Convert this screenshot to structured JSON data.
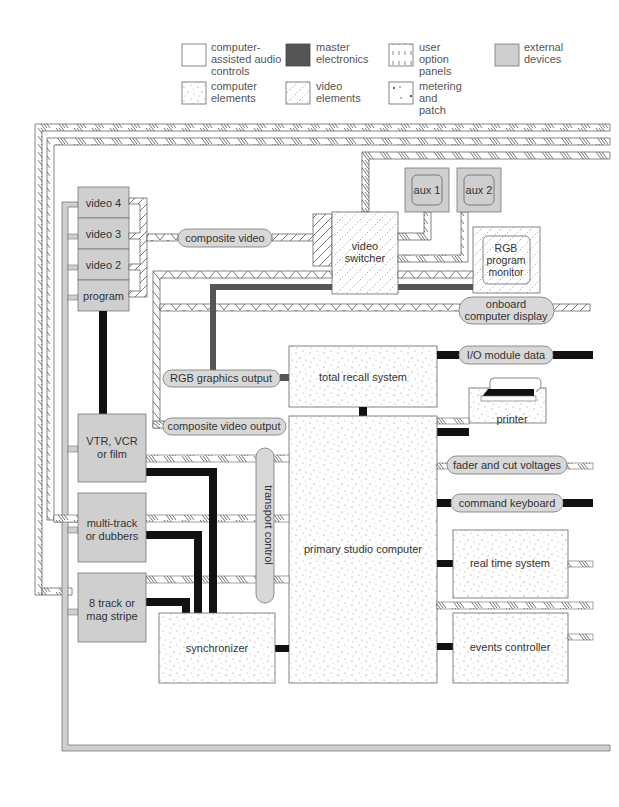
{
  "legend": {
    "items": [
      {
        "key": "computer-assisted-audio-controls",
        "lines": [
          "computer-",
          "assisted audio",
          "controls"
        ],
        "swatch": "plain"
      },
      {
        "key": "master-electronics",
        "lines": [
          "master",
          "electronics"
        ],
        "swatch": "dark"
      },
      {
        "key": "user-option-panels",
        "lines": [
          "user",
          "option",
          "panels"
        ],
        "swatch": "vertical-dash"
      },
      {
        "key": "external-devices",
        "lines": [
          "external",
          "devices"
        ],
        "swatch": "gray"
      },
      {
        "key": "computer-elements",
        "lines": [
          "computer",
          "elements"
        ],
        "swatch": "dots"
      },
      {
        "key": "video-elements",
        "lines": [
          "video",
          "elements"
        ],
        "swatch": "diag-dots"
      },
      {
        "key": "metering-and-patch",
        "lines": [
          "metering",
          "and",
          "patch"
        ],
        "swatch": "sparse-dots"
      }
    ]
  },
  "colors": {
    "external": "#cfcfcf",
    "master": "#555555",
    "bus_black": "#111111",
    "stroke": "#666666",
    "text": "#444444"
  },
  "nodes": {
    "video4": "video 4",
    "video3": "video 3",
    "video2": "video 2",
    "program": "program",
    "composite_video": "composite video",
    "video_switcher": [
      "video",
      "switcher"
    ],
    "aux1": "aux 1",
    "aux2": "aux 2",
    "rgb_monitor": [
      "RGB",
      "program",
      "monitor"
    ],
    "onboard_display": [
      "onboard",
      "computer display"
    ],
    "rgb_graphics_output": "RGB graphics output",
    "total_recall": "total recall system",
    "io_module": "I/O module data",
    "printer": "printer",
    "composite_video_output": "composite video output",
    "vtr": [
      "VTR, VCR",
      "or film"
    ],
    "multitrack": [
      "multi-track",
      "or dubbers"
    ],
    "eight_track": [
      "8 track or",
      "mag stripe"
    ],
    "transport_control": "transport control",
    "primary_computer": "primary studio computer",
    "fader_cut": "fader and cut voltages",
    "command_keyboard": "command keyboard",
    "real_time": "real time system",
    "synchronizer": "synchronizer",
    "events_controller": "events controller"
  }
}
